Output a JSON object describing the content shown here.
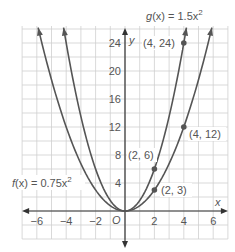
{
  "chart_data": {
    "type": "line",
    "title": "",
    "xlabel": "x",
    "ylabel": "y",
    "origin_label": "O",
    "xlim": [
      -7,
      7
    ],
    "ylim": [
      -4,
      26
    ],
    "grid": true,
    "x_ticks": [
      -6,
      -4,
      -2,
      2,
      4,
      6
    ],
    "x_tick_labels": [
      "−6",
      "−4",
      "−2",
      "2",
      "4",
      "6"
    ],
    "y_ticks": [
      4,
      8,
      12,
      16,
      20,
      24
    ],
    "y_tick_labels": [
      "4",
      "8",
      "12",
      "16",
      "20",
      "24"
    ],
    "series": [
      {
        "name": "g(x) = 1.5x²",
        "label": "g(x) = 1.5x",
        "coefficient": 1.5,
        "points": [
          {
            "x": 2,
            "y": 6,
            "label": "(2, 6)"
          },
          {
            "x": 4,
            "y": 24,
            "label": "(4, 24)"
          }
        ]
      },
      {
        "name": "f(x) = 0.75x²",
        "label": "f(x) = 0.75x",
        "coefficient": 0.75,
        "points": [
          {
            "x": 2,
            "y": 3,
            "label": "(2, 3)"
          },
          {
            "x": 4,
            "y": 12,
            "label": "(4, 12)"
          }
        ]
      }
    ],
    "colors": {
      "curve": "#555555",
      "grid": "#cccccc",
      "axis": "#333333",
      "text": "#555555"
    }
  },
  "labels": {
    "g_func": "g",
    "g_eq": "(x) = 1.5x",
    "f_func": "f",
    "f_eq": "(x) = 0.75x",
    "sup": "2",
    "p_2_6": "(2, 6)",
    "p_4_24": "(4, 24)",
    "p_2_3": "(2, 3)",
    "p_4_12": "(4, 12)"
  }
}
